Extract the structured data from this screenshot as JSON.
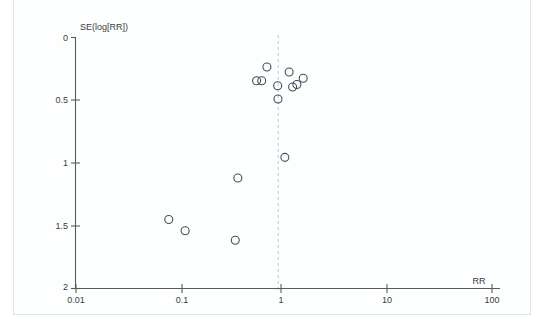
{
  "figure": {
    "kind": "funnel-plot",
    "background_color": "#ffffff",
    "frame_color": "#dce9ec",
    "reference_line_color": "#9fd2e0",
    "point_stroke_color": "#4a4a5a",
    "axis_color": "#5a5a5a"
  },
  "chart_data": {
    "type": "scatter",
    "title": "",
    "xlabel": "RR",
    "ylabel": "SE(log[RR])",
    "x_scale": "log",
    "xlim": [
      0.01,
      100
    ],
    "ylim": [
      0,
      2
    ],
    "y_inverted": true,
    "grid": false,
    "legend": null,
    "xticks": [
      "0.01",
      "0.1",
      "1",
      "10",
      "100"
    ],
    "xtick_values": [
      0.01,
      0.1,
      1,
      10,
      100
    ],
    "yticks": [
      "0",
      "0.5",
      "1",
      "1.5",
      "2"
    ],
    "ytick_values": [
      0,
      0.5,
      1,
      1.5,
      2
    ],
    "annotations": [
      {
        "name": "pooled-effect-reference-line",
        "type": "vline",
        "x": 0.88,
        "style": "dashed",
        "color": "#9fd2e0"
      }
    ],
    "series": [
      {
        "name": "studies",
        "marker": "open-circle",
        "points": [
          {
            "x": 0.685,
            "y": 0.235
          },
          {
            "x": 0.545,
            "y": 0.345
          },
          {
            "x": 0.61,
            "y": 0.345
          },
          {
            "x": 1.12,
            "y": 0.275
          },
          {
            "x": 0.87,
            "y": 0.385
          },
          {
            "x": 1.21,
            "y": 0.395
          },
          {
            "x": 1.33,
            "y": 0.375
          },
          {
            "x": 1.53,
            "y": 0.325
          },
          {
            "x": 0.875,
            "y": 0.49
          },
          {
            "x": 1.02,
            "y": 0.955
          },
          {
            "x": 0.36,
            "y": 1.12
          },
          {
            "x": 0.078,
            "y": 1.45
          },
          {
            "x": 0.112,
            "y": 1.54
          },
          {
            "x": 0.34,
            "y": 1.615
          }
        ]
      }
    ]
  }
}
